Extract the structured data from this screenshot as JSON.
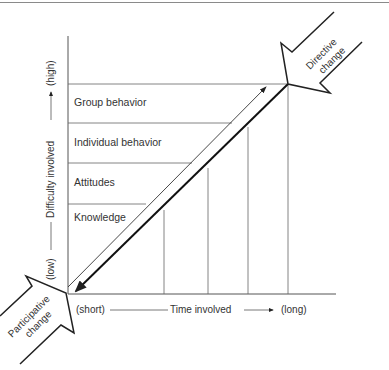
{
  "diagram": {
    "bands": [
      {
        "label": "Group behavior"
      },
      {
        "label": "Individual behavior"
      },
      {
        "label": "Attitudes"
      },
      {
        "label": "Knowledge"
      }
    ],
    "y_axis": {
      "low": "(low)",
      "title": "Difficulty involved",
      "high": "(high)"
    },
    "x_axis": {
      "short": "(short)",
      "title": "Time involved",
      "long": "(long)"
    },
    "arrows": {
      "directive": {
        "line1": "Directive",
        "line2": "change"
      },
      "participative": {
        "line1": "Participative",
        "line2": "change"
      }
    },
    "colors": {
      "line": "#555555",
      "thick_line": "#222222",
      "text": "#333333"
    }
  }
}
